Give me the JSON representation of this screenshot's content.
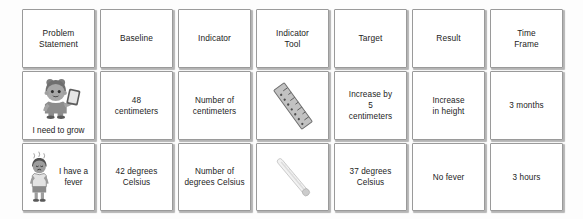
{
  "table": {
    "headers": [
      {
        "id": "problem-statement",
        "label": "Problem\nStatement"
      },
      {
        "id": "baseline",
        "label": "Baseline"
      },
      {
        "id": "indicator",
        "label": "Indicator"
      },
      {
        "id": "indicator-tool",
        "label": "Indicator\nTool"
      },
      {
        "id": "target",
        "label": "Target"
      },
      {
        "id": "result",
        "label": "Result"
      },
      {
        "id": "time-frame",
        "label": "Time\nFrame"
      }
    ],
    "rows": [
      {
        "id": "row-grow",
        "problem_statement": {
          "caption": "I need to grow",
          "icon": "child-with-phone-illustration"
        },
        "baseline": "48\ncentimeters",
        "indicator": "Number of\ncentimeters",
        "indicator_tool": {
          "icon": "ruler-icon",
          "label": ""
        },
        "target": "Increase by\n5\ncentimeters",
        "result": "Increase\nin height",
        "time_frame": "3 months"
      },
      {
        "id": "row-fever",
        "problem_statement": {
          "caption": "I have a\nfever",
          "icon": "sick-child-illustration"
        },
        "baseline": "42 degrees\nCelsius",
        "indicator": "Number of\ndegrees Celsius",
        "indicator_tool": {
          "icon": "thermometer-icon",
          "label": ""
        },
        "target": "37 degrees\nCelsius",
        "result": "No fever",
        "time_frame": "3 hours"
      }
    ]
  },
  "colors": {
    "page_background": "#fdfdfd",
    "cell_background": "#ffffff",
    "cell_border": "#9a9a9a",
    "text": "#232323",
    "ruler_body": "#b9b9b9",
    "thermometer_body": "#d9d9d9",
    "illustration_mid": "#8e8e8e",
    "illustration_dark": "#4a4a4a"
  }
}
